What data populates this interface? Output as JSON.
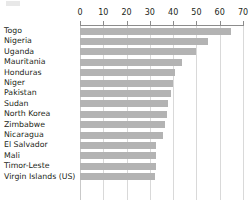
{
  "chart": {
    "type": "bar",
    "orientation": "horizontal",
    "title": "",
    "subtitle": "",
    "xlabel": "",
    "ylabel": "",
    "bar_color": "#b3b3b3",
    "gridline_color": "#d9d9d9",
    "axis_color": "#8c8c8c",
    "text_color": "#231f20",
    "background": "#ffffff",
    "grid": true,
    "legend": false,
    "axis_position": "top"
  },
  "chart_data": {
    "type": "bar",
    "title": "",
    "xlabel": "",
    "ylabel": "",
    "xlim": [
      0,
      70
    ],
    "ylim": null,
    "grid": true,
    "legend_position": "none",
    "orientation": "horizontal",
    "xticks": [
      0,
      10,
      20,
      30,
      40,
      50,
      60,
      70
    ],
    "xtick_labels": [
      "0",
      "10",
      "20",
      "30",
      "40",
      "50",
      "60",
      "70"
    ],
    "categories": [
      "Togo",
      "Nigeria",
      "Uganda",
      "Mauritania",
      "Honduras",
      "Niger",
      "Pakistan",
      "Sudan",
      "North Korea",
      "Zimbabwe",
      "Nicaragua",
      "El Salvador",
      "Mali",
      "Timor-Leste",
      "Virgin Islands (US)"
    ],
    "values": [
      65,
      55,
      50,
      44,
      41,
      40,
      39,
      38,
      37.5,
      36.5,
      35.5,
      32.5,
      32.5,
      32.5,
      32
    ]
  }
}
